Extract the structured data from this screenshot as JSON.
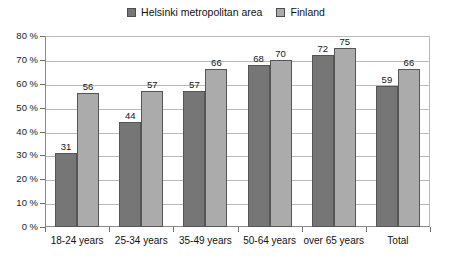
{
  "chart_data": {
    "type": "bar",
    "title": "",
    "xlabel": "",
    "ylabel": "",
    "ylim": [
      0,
      80
    ],
    "ytick_step": 10,
    "ytick_suffix": " %",
    "grid": true,
    "legend_position": "top-center",
    "categories": [
      "18-24 years",
      "25-34 years",
      "35-49 years",
      "50-64 years",
      "over 65 years",
      "Total"
    ],
    "series": [
      {
        "name": "Helsinki metropolitan area",
        "color": "#767676",
        "values": [
          31,
          44,
          57,
          68,
          72,
          59
        ]
      },
      {
        "name": "Finland",
        "color": "#ababab",
        "values": [
          56,
          57,
          66,
          70,
          75,
          66
        ]
      }
    ],
    "ytick_labels": [
      "0 %",
      "10 %",
      "20 %",
      "30 %",
      "40 %",
      "50 %",
      "60 %",
      "70 %",
      "80 %"
    ]
  },
  "legend": {
    "entries": [
      {
        "label": "Helsinki metropolitan area",
        "color": "#767676"
      },
      {
        "label": "Finland",
        "color": "#ababab"
      }
    ]
  }
}
